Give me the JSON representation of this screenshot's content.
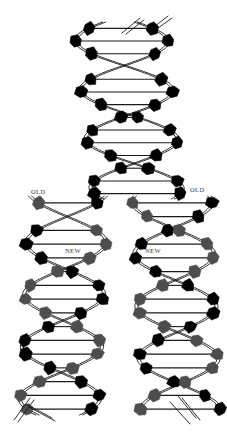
{
  "figure": {
    "background_color": "#ffffff",
    "width": 227,
    "height": 439
  },
  "labels": {
    "old_left": "OLD",
    "old_right": "OLD",
    "new_left": "NEW",
    "new_right": "NEW"
  },
  "legend_semantics": {
    "old_strand": {
      "name": "old strand",
      "base_color": "#000000",
      "meaning": "parental template strand"
    },
    "new_strand": {
      "name": "new strand",
      "base_color": "#4d4d4d",
      "meaning": "newly synthesized daughter strand"
    }
  },
  "colors": {
    "backbone": "#1a1a1a",
    "base_black": "#000000",
    "base_gray": "#4d4d4d",
    "rung": "#1a1a1a",
    "label_text": "#3b3b3b"
  },
  "chart_data": {
    "type": "diagram",
    "fork_y": 200,
    "parent_helix": {
      "name": "parent double helix",
      "x_center": 120,
      "y_top": 22,
      "y_bottom": 200,
      "amplitude": 46,
      "period": 98,
      "phase": 0.35,
      "lean": 0.1,
      "base_color": "#000000",
      "rung_count": 14
    },
    "daughter_helices": [
      {
        "name": "left daughter helix",
        "x_center": 68,
        "y_top": 196,
        "y_bottom": 416,
        "amplitude": 40,
        "period": 104,
        "phase": 1.9,
        "lean": -0.04,
        "old_color": "#000000",
        "new_color": "#4d4d4d",
        "rung_count": 16
      },
      {
        "name": "right daughter helix",
        "x_center": 172,
        "y_top": 196,
        "y_bottom": 416,
        "amplitude": 40,
        "period": 104,
        "phase": 1.2,
        "lean": 0.04,
        "old_color": "#000000",
        "new_color": "#4d4d4d",
        "rung_count": 16
      }
    ]
  }
}
